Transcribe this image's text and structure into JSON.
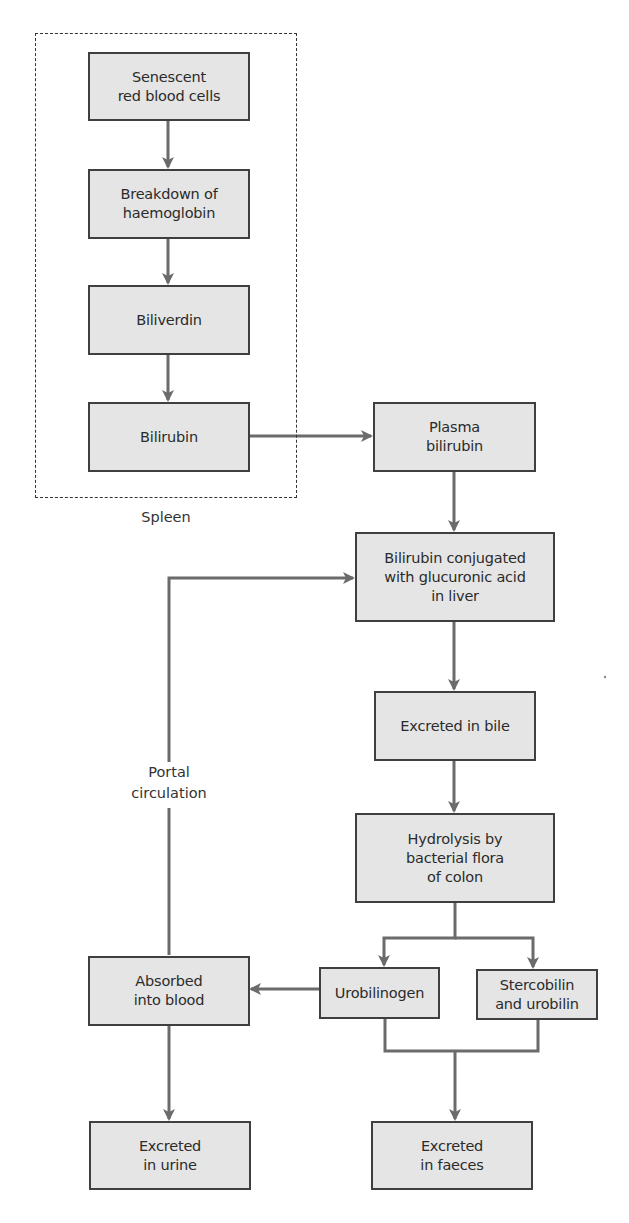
{
  "diagram": {
    "colors": {
      "box_fill": "#e5e5e5",
      "box_border": "#3f3f3f",
      "arrow": "#6b6b6b",
      "text": "#2b2b2b"
    },
    "group": {
      "label": "Spleen"
    },
    "nodes": {
      "senescent_rbc": "Senescent\nred blood cells",
      "breakdown_hb": "Breakdown of\nhaemoglobin",
      "biliverdin": "Biliverdin",
      "bilirubin": "Bilirubin",
      "plasma_bilirubin": "Plasma\nbilirubin",
      "conjugated": "Bilirubin conjugated\nwith glucuronic acid\nin liver",
      "excreted_bile": "Excreted in bile",
      "hydrolysis": "Hydrolysis by\nbacterial flora\nof colon",
      "urobilinogen": "Urobilinogen",
      "stercobilin": "Stercobilin\nand urobilin",
      "absorbed_blood": "Absorbed\ninto blood",
      "excreted_urine": "Excreted\nin urine",
      "excreted_faeces": "Excreted\nin faeces"
    },
    "edge_labels": {
      "portal": "Portal\ncirculation"
    },
    "edges": [
      {
        "from": "senescent_rbc",
        "to": "breakdown_hb"
      },
      {
        "from": "breakdown_hb",
        "to": "biliverdin"
      },
      {
        "from": "biliverdin",
        "to": "bilirubin"
      },
      {
        "from": "bilirubin",
        "to": "plasma_bilirubin"
      },
      {
        "from": "plasma_bilirubin",
        "to": "conjugated"
      },
      {
        "from": "conjugated",
        "to": "excreted_bile"
      },
      {
        "from": "excreted_bile",
        "to": "hydrolysis"
      },
      {
        "from": "hydrolysis",
        "to": "urobilinogen"
      },
      {
        "from": "hydrolysis",
        "to": "stercobilin"
      },
      {
        "from": "urobilinogen",
        "to": "absorbed_blood"
      },
      {
        "from": "absorbed_blood",
        "to": "conjugated",
        "label": "Portal circulation"
      },
      {
        "from": "absorbed_blood",
        "to": "excreted_urine"
      },
      {
        "from": "urobilinogen",
        "to": "excreted_faeces"
      },
      {
        "from": "stercobilin",
        "to": "excreted_faeces"
      }
    ]
  }
}
